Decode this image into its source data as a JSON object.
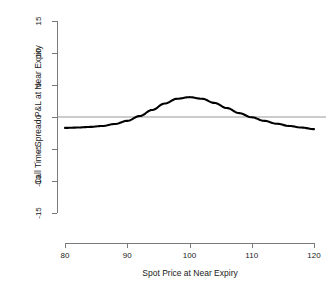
{
  "chart_data": {
    "type": "line",
    "title": "",
    "xlabel": "Spot Price at Near Expiry",
    "ylabel": "Call Time Spread P&L at Near Expiry",
    "xlim": [
      80,
      120
    ],
    "ylim": [
      -15,
      15
    ],
    "xticks": [
      "80",
      "90",
      "100",
      "110",
      "120"
    ],
    "yticks": [
      "15",
      "10",
      "5",
      "0",
      "-5",
      "-10",
      "-15"
    ],
    "grid": false,
    "legend": null,
    "reference_lines": [
      {
        "name": "zero-line",
        "axis": "y",
        "value": 0,
        "color": "#999999"
      }
    ],
    "series": [
      {
        "name": "Call Time Spread P&L",
        "color": "#000000",
        "x": [
          80,
          82,
          84,
          86,
          88,
          90,
          92,
          94,
          96,
          98,
          100,
          102,
          104,
          106,
          108,
          110,
          112,
          114,
          116,
          118,
          120
        ],
        "y": [
          -1.7,
          -1.65,
          -1.55,
          -1.4,
          -1.1,
          -0.6,
          0.15,
          1.1,
          2.1,
          2.85,
          3.1,
          2.85,
          2.2,
          1.4,
          0.6,
          -0.05,
          -0.6,
          -1.05,
          -1.4,
          -1.65,
          -1.9
        ]
      }
    ]
  },
  "axes": {
    "y_tick_values": [
      15,
      10,
      5,
      0,
      -5,
      -10,
      -15
    ],
    "x_tick_values": [
      80,
      90,
      100,
      110,
      120
    ]
  },
  "colors": {
    "curve": "#000000",
    "axis": "#7a7a7a",
    "zero_line": "#999999",
    "background": "#ffffff",
    "text": "#1a1a1a"
  }
}
